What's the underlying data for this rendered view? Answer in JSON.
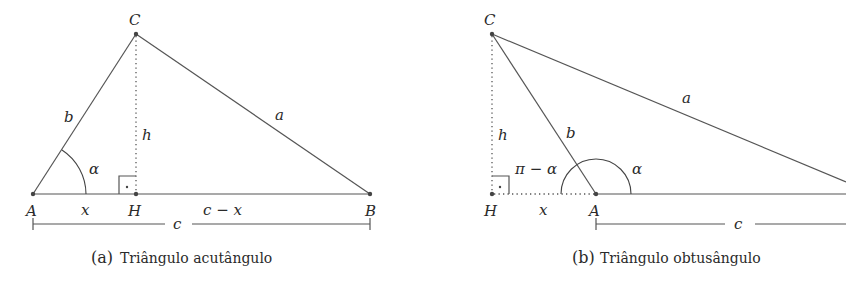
{
  "figure_a": {
    "caption_prefix": "(a)",
    "caption": "Triângulo acutângulo",
    "vertices": {
      "A": "A",
      "B": "B",
      "C": "C",
      "H": "H"
    },
    "sides": {
      "a": "a",
      "b": "b",
      "c": "c",
      "h": "h"
    },
    "segments": {
      "x": "x",
      "c_minus_x": "c − x"
    },
    "angle": "α"
  },
  "figure_b": {
    "caption_prefix": "(b)",
    "caption": "Triângulo obtusângulo",
    "vertices": {
      "A": "A",
      "C": "C",
      "H": "H"
    },
    "sides": {
      "a": "a",
      "b": "b",
      "c": "c",
      "h": "h"
    },
    "segments": {
      "x": "x"
    },
    "angle": "α",
    "supplementary_angle": "π − α"
  }
}
